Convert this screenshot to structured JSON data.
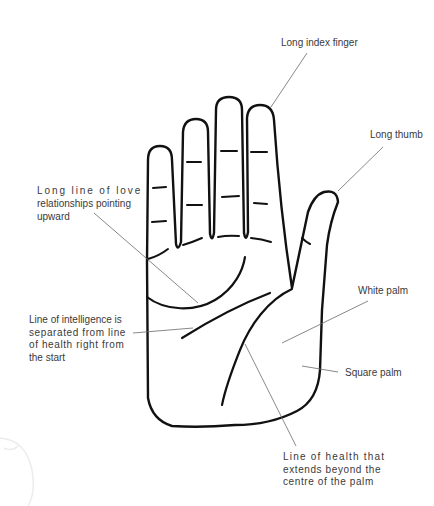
{
  "diagram": {
    "colors": {
      "ink": "#111111",
      "leader": "#6a6a6a",
      "label_text": "#3a3a3a",
      "background": "#ffffff"
    }
  },
  "labels": {
    "index_finger": {
      "lines": [
        "Long index finger"
      ]
    },
    "thumb": {
      "lines": [
        "Long thumb"
      ]
    },
    "love_line": {
      "lines": [
        "Long line of love",
        "relationships pointing",
        "upward"
      ]
    },
    "intelligence_line": {
      "lines": [
        "Line of intelligence is",
        "separated from line",
        "of health right from",
        "the start"
      ]
    },
    "white_palm": {
      "lines": [
        "White palm"
      ]
    },
    "square_palm": {
      "lines": [
        "Square palm"
      ]
    },
    "health_line": {
      "lines": [
        "Line of health that",
        "extends beyond the",
        "centre of the palm"
      ]
    }
  }
}
